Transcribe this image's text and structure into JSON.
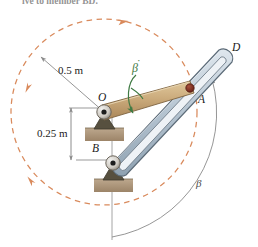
{
  "figure": {
    "caption_fragment": "ive to member BD.",
    "labels": {
      "dim_outer": "0.5 m",
      "dim_inner": "0.25 m",
      "point_o": "O",
      "point_a": "A",
      "point_b": "B",
      "point_d": "D",
      "beta_dot": "β",
      "beta_dot_accent": "˙",
      "beta_angle": "β"
    },
    "icon_names": {
      "pivot_o": "pin-support-icon",
      "pivot_b": "pin-support-icon",
      "pin_a": "slider-pin-icon",
      "circle_path": "dashed-circle-path-icon",
      "rotation_arrow": "curved-rotation-arrow-icon",
      "angle_arc": "angle-arc-icon",
      "dimension_line": "dimension-line-icon"
    },
    "colors": {
      "circle_dashed": "#d98a5c",
      "arm_oa_fill": "#c9a878",
      "arm_oa_edge": "#8a6f45",
      "slot_member_fill": "#b8c6d2",
      "slot_member_edge": "#5c6b78",
      "pin_a": "#7a2b1e",
      "support_block": "#b09a80",
      "support_bracket": "#5e5548",
      "leader_gray": "#8a8a8a",
      "beta_green": "#3f7a43",
      "arc_gray": "#808080",
      "text": "#1a1a1a"
    },
    "geometry": {
      "note": "O pivot and B pivot on vertical line; member OA is short tan link; member BD is long slotted arm from B to D; dashed circle is path of A about O",
      "o_x": 104,
      "o_y": 112,
      "b_x": 113,
      "b_y": 163,
      "d_x": 224,
      "d_y": 56,
      "a_x": 190,
      "a_y": 88,
      "circle_cx": 104,
      "circle_cy": 112,
      "circle_r": 93
    }
  }
}
